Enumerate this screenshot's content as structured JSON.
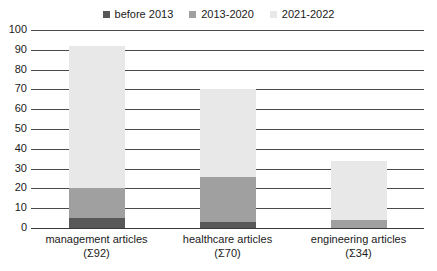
{
  "chart_data": {
    "type": "bar",
    "title": "",
    "xlabel": "",
    "ylabel": "",
    "stacked": true,
    "grid": true,
    "legend_position": "top-center",
    "ylim": [
      0,
      100
    ],
    "ytick_step": 10,
    "yticks": [
      "100",
      "90",
      "80",
      "70",
      "60",
      "50",
      "40",
      "30",
      "20",
      "10",
      "0"
    ],
    "categories": [
      "management articles",
      "healthcare articles",
      "engineering articles"
    ],
    "category_totals": [
      "(Σ92)",
      "(Σ70)",
      "(Σ34)"
    ],
    "series": [
      {
        "name": "before 2013",
        "color": "#585858",
        "values": [
          5,
          3,
          0
        ]
      },
      {
        "name": "2013-2020",
        "color": "#a0a0a0",
        "values": [
          15,
          23,
          4
        ]
      },
      {
        "name": "2021-2022",
        "color": "#e8e8e8",
        "values": [
          72,
          44,
          30
        ]
      }
    ],
    "totals": [
      92,
      70,
      34
    ]
  },
  "legend": {
    "items": [
      {
        "label": "before 2013",
        "color": "#585858"
      },
      {
        "label": "2013-2020",
        "color": "#a0a0a0"
      },
      {
        "label": "2021-2022",
        "color": "#e8e8e8"
      }
    ]
  },
  "colors": {
    "before_2013": "#585858",
    "period_2013_2020": "#a0a0a0",
    "period_2021_2022": "#e8e8e8",
    "gridline": "#4a4a4a",
    "text": "#1a1a1a",
    "background": "#ffffff"
  }
}
